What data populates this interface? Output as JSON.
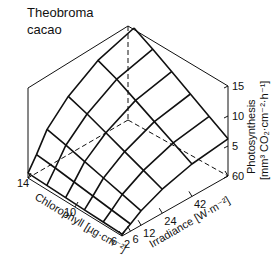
{
  "chart_data": {
    "type": "surface3d",
    "title": "Theobroma cacao",
    "title_lines": [
      "Theobroma",
      "cacao"
    ],
    "xlabel": "Chlorophyll [µg·cm⁻²]",
    "ylabel": "Irradiance [W·m⁻²]",
    "zlabel": "Photosynthesis [mm³ CO₂·cm⁻²·h⁻¹]",
    "zlabel_lines": [
      "Photosynthesis",
      "[mm³ CO₂·cm⁻²·h⁻¹]"
    ],
    "x_ticks": [
      6,
      10,
      14
    ],
    "x_range": [
      6,
      14
    ],
    "y_ticks": [
      2,
      6,
      12,
      24,
      42,
      60
    ],
    "y_range": [
      2,
      60
    ],
    "z_ticks": [
      5,
      10,
      15
    ],
    "z_range": [
      0,
      15
    ],
    "grid_chlorophyll": [
      6,
      7.6,
      9.2,
      10.8,
      12.4,
      14
    ],
    "grid_irradiance": [
      2,
      6,
      12,
      24,
      42,
      60
    ],
    "z_values": [
      [
        0.3,
        1.2,
        2.4,
        4.0,
        5.4,
        6.2
      ],
      [
        0.4,
        1.6,
        3.2,
        5.2,
        7.0,
        8.0
      ],
      [
        0.5,
        2.0,
        4.0,
        6.4,
        8.6,
        9.8
      ],
      [
        0.6,
        2.4,
        4.8,
        7.6,
        10.2,
        11.6
      ],
      [
        0.7,
        2.8,
        5.6,
        8.8,
        11.8,
        13.4
      ],
      [
        0.8,
        3.1,
        6.3,
        9.8,
        13.0,
        15.0
      ]
    ],
    "surface_note": "Photosynthesis increases with both chlorophyll and irradiance, saturating toward high irradiance; maximum ~15 at 14 µg·cm⁻², 60 W·m⁻²"
  },
  "labels": {
    "z_tick_0": "60",
    "z_tick_5": "5",
    "z_tick_10": "10",
    "z_tick_15": "15"
  }
}
